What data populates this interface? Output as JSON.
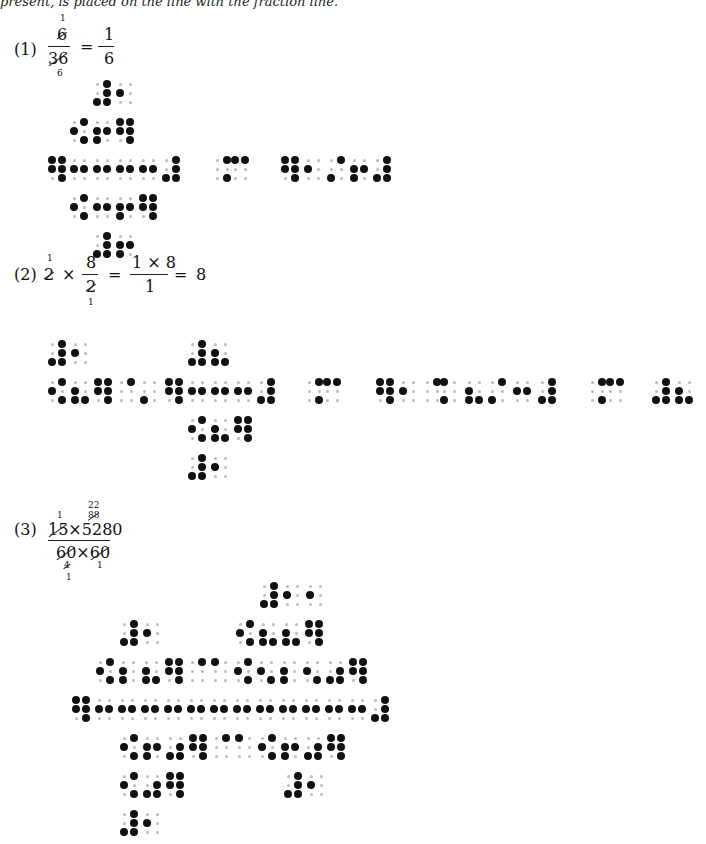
{
  "intro_text": "present, is placed on the line with the fraction line.",
  "examples": [
    {
      "label": "(1)",
      "math": {
        "lhs_num": "6",
        "lhs_num_cancel": "1",
        "lhs_den": "36",
        "lhs_den_cancel": "6",
        "eq": "=",
        "rhs_num": "1",
        "rhs_den": "6"
      },
      "braille_rows": [
        {
          "y": 80,
          "cells": [
            {
              "x": 93,
              "d": "3456"
            },
            {
              "x": 116,
              "d": "2"
            }
          ]
        },
        {
          "y": 118,
          "cells": [
            {
              "x": 70,
              "d": "246"
            },
            {
              "x": 93,
              "d": "235"
            },
            {
              "x": 116,
              "d": "12456"
            }
          ]
        },
        {
          "y": 156,
          "cells": [
            {
              "x": 48,
              "d": "12456"
            },
            {
              "x": 70,
              "d": "25"
            },
            {
              "x": 93,
              "d": "25"
            },
            {
              "x": 116,
              "d": "25"
            },
            {
              "x": 139,
              "d": "25"
            },
            {
              "x": 162,
              "d": "4563"
            },
            {
              "x": 213,
              "d": "46"
            },
            {
              "x": 231,
              "d": "14"
            },
            {
              "x": 281,
              "d": "12456"
            },
            {
              "x": 304,
              "d": "2"
            },
            {
              "x": 327,
              "d": "43"
            },
            {
              "x": 350,
              "d": "235"
            },
            {
              "x": 373,
              "d": "4563"
            }
          ]
        },
        {
          "y": 194,
          "cells": [
            {
              "x": 70,
              "d": "246"
            },
            {
              "x": 93,
              "d": "25"
            },
            {
              "x": 116,
              "d": "235"
            },
            {
              "x": 139,
              "d": "12456"
            }
          ]
        },
        {
          "y": 232,
          "cells": [
            {
              "x": 93,
              "d": "3456"
            },
            {
              "x": 116,
              "d": "235"
            }
          ]
        }
      ]
    },
    {
      "label": "(2)",
      "math": {
        "a": "2",
        "a_cancel": "1",
        "times": "×",
        "b_num": "8",
        "b_den": "2",
        "b_den_cancel": "1",
        "eq1": "=",
        "c_num": "1 × 8",
        "c_den": "1",
        "eq2": "=",
        "result": "8"
      },
      "braille_rows": [
        {
          "y": 340,
          "cells": [
            {
              "x": 48,
              "d": "3456"
            },
            {
              "x": 71,
              "d": "2"
            },
            {
              "x": 188,
              "d": "3456"
            },
            {
              "x": 211,
              "d": "236"
            }
          ]
        },
        {
          "y": 378,
          "cells": [
            {
              "x": 48,
              "d": "246"
            },
            {
              "x": 71,
              "d": "236"
            },
            {
              "x": 94,
              "d": "12456"
            },
            {
              "x": 117,
              "d": "4"
            },
            {
              "x": 140,
              "d": "3"
            },
            {
              "x": 165,
              "d": "12456"
            },
            {
              "x": 188,
              "d": "25"
            },
            {
              "x": 211,
              "d": "25"
            },
            {
              "x": 234,
              "d": "25"
            },
            {
              "x": 257,
              "d": "4563"
            },
            {
              "x": 305,
              "d": "46"
            },
            {
              "x": 323,
              "d": "14"
            },
            {
              "x": 376,
              "d": "12456"
            },
            {
              "x": 399,
              "d": "2"
            },
            {
              "x": 423,
              "d": "4"
            },
            {
              "x": 440,
              "d": "13"
            },
            {
              "x": 465,
              "d": "236"
            },
            {
              "x": 488,
              "d": "43"
            },
            {
              "x": 513,
              "d": "25"
            },
            {
              "x": 538,
              "d": "4563"
            },
            {
              "x": 588,
              "d": "46"
            },
            {
              "x": 606,
              "d": "14"
            },
            {
              "x": 652,
              "d": "3456"
            },
            {
              "x": 675,
              "d": "236"
            }
          ]
        },
        {
          "y": 416,
          "cells": [
            {
              "x": 188,
              "d": "246"
            },
            {
              "x": 211,
              "d": "236"
            },
            {
              "x": 234,
              "d": "12456"
            }
          ]
        },
        {
          "y": 454,
          "cells": [
            {
              "x": 188,
              "d": "3456"
            },
            {
              "x": 211,
              "d": "2"
            }
          ]
        }
      ]
    },
    {
      "label": "(3)",
      "math": {
        "num_a": "15",
        "num_a_cancel": "1",
        "times1": "×",
        "num_b": "5280",
        "num_b_cancel": "88",
        "num_b_cancel2": "22",
        "den_a": "60",
        "den_a_cancel": "4",
        "den_a_cancel2": "1",
        "times2": "×",
        "den_b": "60",
        "den_b_cancel": "1"
      },
      "braille_rows": [
        {
          "y": 582,
          "cells": [
            {
              "x": 260,
              "d": "3456"
            },
            {
              "x": 283,
              "d": "2"
            },
            {
              "x": 306,
              "d": "2"
            }
          ]
        },
        {
          "y": 620,
          "cells": [
            {
              "x": 120,
              "d": "3456"
            },
            {
              "x": 143,
              "d": "2"
            },
            {
              "x": 236,
              "d": "246"
            },
            {
              "x": 259,
              "d": "236"
            },
            {
              "x": 282,
              "d": "236"
            },
            {
              "x": 305,
              "d": "12456"
            }
          ]
        },
        {
          "y": 658,
          "cells": [
            {
              "x": 96,
              "d": "246"
            },
            {
              "x": 119,
              "d": "23"
            },
            {
              "x": 142,
              "d": "236"
            },
            {
              "x": 165,
              "d": "12456"
            },
            {
              "x": 188,
              "d": "4"
            },
            {
              "x": 211,
              "d": "1"
            },
            {
              "x": 234,
              "d": "246"
            },
            {
              "x": 257,
              "d": "26"
            },
            {
              "x": 280,
              "d": "23"
            },
            {
              "x": 303,
              "d": "26"
            },
            {
              "x": 326,
              "d": "356"
            },
            {
              "x": 349,
              "d": "12456"
            }
          ]
        },
        {
          "y": 696,
          "cells": [
            {
              "x": 72,
              "d": "12456"
            },
            {
              "x": 95,
              "d": "25"
            },
            {
              "x": 118,
              "d": "25"
            },
            {
              "x": 141,
              "d": "25"
            },
            {
              "x": 164,
              "d": "25"
            },
            {
              "x": 187,
              "d": "25"
            },
            {
              "x": 210,
              "d": "25"
            },
            {
              "x": 233,
              "d": "25"
            },
            {
              "x": 256,
              "d": "25"
            },
            {
              "x": 279,
              "d": "25"
            },
            {
              "x": 302,
              "d": "25"
            },
            {
              "x": 325,
              "d": "25"
            },
            {
              "x": 348,
              "d": "25"
            },
            {
              "x": 371,
              "d": "4563"
            }
          ]
        },
        {
          "y": 734,
          "cells": [
            {
              "x": 120,
              "d": "246"
            },
            {
              "x": 143,
              "d": "235"
            },
            {
              "x": 166,
              "d": "356"
            },
            {
              "x": 189,
              "d": "12456"
            },
            {
              "x": 212,
              "d": "4"
            },
            {
              "x": 235,
              "d": "1"
            },
            {
              "x": 258,
              "d": "246"
            },
            {
              "x": 281,
              "d": "235"
            },
            {
              "x": 304,
              "d": "356"
            },
            {
              "x": 327,
              "d": "12456"
            }
          ]
        },
        {
          "y": 772,
          "cells": [
            {
              "x": 120,
              "d": "246"
            },
            {
              "x": 143,
              "d": "356"
            },
            {
              "x": 166,
              "d": "12456"
            },
            {
              "x": 284,
              "d": "3456"
            },
            {
              "x": 307,
              "d": "2"
            }
          ]
        },
        {
          "y": 810,
          "cells": [
            {
              "x": 120,
              "d": "3456"
            },
            {
              "x": 143,
              "d": "2"
            }
          ]
        }
      ]
    }
  ]
}
